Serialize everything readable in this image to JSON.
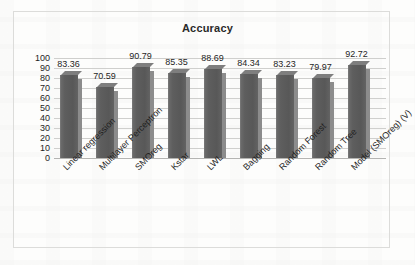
{
  "chart_data": {
    "type": "bar",
    "title": "Accuracy",
    "xlabel": "",
    "ylabel": "",
    "categories": [
      "Linear regression",
      "Multilayer Perceptron",
      "SMOreg",
      "Kstar",
      "LWL",
      "Bagging",
      "Random Forest",
      "Random Tree",
      "Model (SMOreg) (V)"
    ],
    "values": [
      83.36,
      70.59,
      90.79,
      85.35,
      88.69,
      84.34,
      83.23,
      79.97,
      92.72
    ],
    "value_labels": [
      "83.36",
      "70.59",
      "90.79",
      "85.35",
      "88.69",
      "84.34",
      "83.23",
      "79.97",
      "92.72"
    ],
    "ylim": [
      0,
      100
    ],
    "ytick_labels": [
      "100",
      "90",
      "80",
      "70",
      "60",
      "50",
      "40",
      "30",
      "20",
      "10",
      "0"
    ],
    "ytick_values": [
      100,
      90,
      80,
      70,
      60,
      50,
      40,
      30,
      20,
      10,
      0
    ],
    "grid": true,
    "legend": false,
    "legend_position": "none",
    "bar_color": "#5e5e5e",
    "bar_side_color": "#8c8c8c",
    "gridline_color": "#cfcfcd",
    "text_color": "#1f1f1f",
    "background_color": "#fdfdfc",
    "frame_color": "#dcdcda"
  }
}
